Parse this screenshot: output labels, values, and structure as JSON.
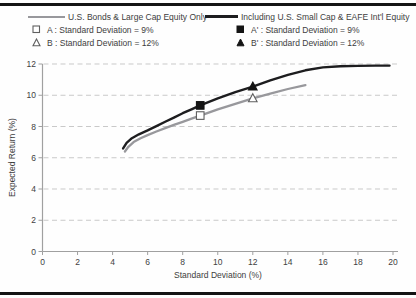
{
  "figure": {
    "background": "#fefefe",
    "top_rule_color": "#141414",
    "bottom_rule_color": "#141414"
  },
  "legend": {
    "left": {
      "line_label": "U.S. Bonds & Large Cap Equity Only",
      "marker_a_label": "A : Standard Deviation = 9%",
      "marker_b_label": "B : Standard Deviation = 12%"
    },
    "right": {
      "line_label": "Including U.S. Small Cap & EAFE Int'l Equity",
      "marker_a_label": "A' : Standard Deviation = 9%",
      "marker_b_label": "B' : Standard Deviation = 12%"
    }
  },
  "chart_data": {
    "type": "line",
    "title": "",
    "xlabel": "Standard Deviation (%)",
    "ylabel": "Expected Return (%)",
    "xlim": [
      0,
      20
    ],
    "ylim": [
      0,
      12
    ],
    "xticks": [
      0,
      2,
      4,
      6,
      8,
      10,
      12,
      14,
      16,
      18,
      20
    ],
    "yticks": [
      0,
      2,
      4,
      6,
      8,
      10,
      12
    ],
    "grid": "horizontal-dashed",
    "legend_position": "top",
    "series": [
      {
        "name": "U.S. Bonds & Large Cap Equity Only",
        "color": "#98989c",
        "width": 2.3,
        "points": [
          [
            4.7,
            6.4
          ],
          [
            4.9,
            6.7
          ],
          [
            5.2,
            7.0
          ],
          [
            5.6,
            7.25
          ],
          [
            6,
            7.45
          ],
          [
            6.5,
            7.68
          ],
          [
            7,
            7.9
          ],
          [
            7.5,
            8.1
          ],
          [
            8,
            8.3
          ],
          [
            8.5,
            8.5
          ],
          [
            9,
            8.7
          ],
          [
            10,
            9.1
          ],
          [
            11,
            9.45
          ],
          [
            12,
            9.8
          ],
          [
            13,
            10.1
          ],
          [
            14,
            10.4
          ],
          [
            15,
            10.65
          ]
        ]
      },
      {
        "name": "Including U.S. Small Cap & EAFE Int'l Equity",
        "color": "#1d1d1f",
        "width": 2.4,
        "points": [
          [
            4.6,
            6.6
          ],
          [
            4.8,
            6.95
          ],
          [
            5.1,
            7.25
          ],
          [
            5.5,
            7.5
          ],
          [
            6,
            7.75
          ],
          [
            6.5,
            8.02
          ],
          [
            7,
            8.3
          ],
          [
            7.5,
            8.57
          ],
          [
            8,
            8.85
          ],
          [
            8.5,
            9.1
          ],
          [
            9,
            9.35
          ],
          [
            10,
            9.8
          ],
          [
            11,
            10.2
          ],
          [
            12,
            10.55
          ],
          [
            13,
            10.95
          ],
          [
            14,
            11.3
          ],
          [
            15,
            11.6
          ],
          [
            16,
            11.78
          ],
          [
            17,
            11.85
          ],
          [
            18,
            11.88
          ],
          [
            19,
            11.9
          ],
          [
            19.8,
            11.9
          ]
        ]
      }
    ],
    "markers": [
      {
        "name": "A",
        "shape": "square",
        "fill": "open",
        "x": 9,
        "y": 8.7,
        "label": "A : Standard Deviation = 9%"
      },
      {
        "name": "B",
        "shape": "triangle",
        "fill": "open",
        "x": 12,
        "y": 9.8,
        "label": "B : Standard Deviation = 12%"
      },
      {
        "name": "A-prime",
        "shape": "square",
        "fill": "solid",
        "x": 9,
        "y": 9.35,
        "label": "A' : Standard Deviation = 9%"
      },
      {
        "name": "B-prime",
        "shape": "triangle",
        "fill": "solid",
        "x": 12,
        "y": 10.55,
        "label": "B' : Standard Deviation = 12%"
      }
    ],
    "colors": {
      "grid": "#c9c9c9",
      "axis": "#a0a0a0",
      "tick_text": "#414141",
      "marker_open_stroke": "#5f5f5f",
      "marker_solid": "#141414"
    }
  }
}
